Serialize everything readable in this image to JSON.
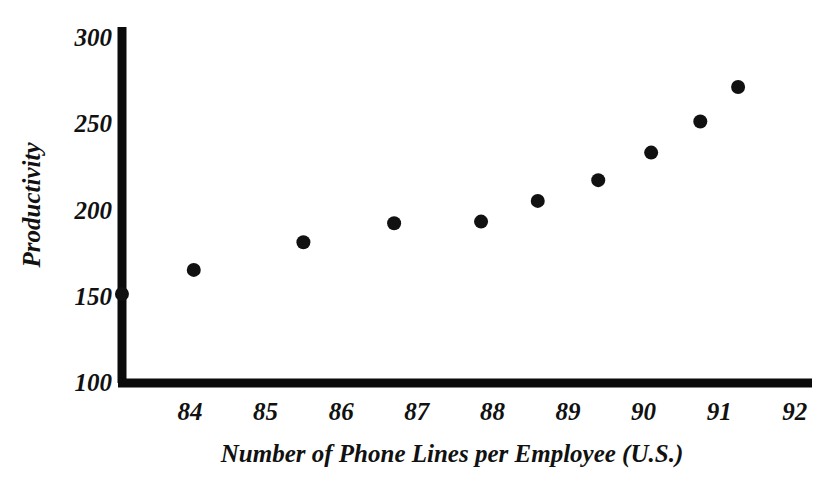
{
  "chart_data": {
    "type": "scatter",
    "title": "",
    "xlabel": "Number of Phone Lines per Employee (U.S.)",
    "ylabel": "Productivity",
    "xlim": [
      82.4,
      92.6
    ],
    "ylim": [
      100,
      305
    ],
    "xticks": [
      84,
      85,
      86,
      87,
      88,
      89,
      90,
      91,
      92
    ],
    "xtick_labels": [
      "84",
      "85",
      "86",
      "87",
      "88",
      "89",
      "90",
      "91",
      "92"
    ],
    "yticks": [
      100,
      150,
      200,
      250,
      300
    ],
    "ytick_labels": [
      "100",
      "150",
      "200",
      "250",
      "300"
    ],
    "grid": false,
    "legend": null,
    "marker": "filled-circle",
    "marker_color": "#111111",
    "points": [
      {
        "x": 83.1,
        "y": 151
      },
      {
        "x": 84.05,
        "y": 165
      },
      {
        "x": 85.5,
        "y": 181
      },
      {
        "x": 86.7,
        "y": 192
      },
      {
        "x": 87.85,
        "y": 193
      },
      {
        "x": 88.6,
        "y": 205
      },
      {
        "x": 89.4,
        "y": 217
      },
      {
        "x": 90.1,
        "y": 233
      },
      {
        "x": 90.75,
        "y": 251
      },
      {
        "x": 91.25,
        "y": 271
      }
    ]
  },
  "colors": {
    "background": "#ffffff",
    "axis": "#0b0b0b",
    "marker": "#111111",
    "text": "#111111"
  }
}
